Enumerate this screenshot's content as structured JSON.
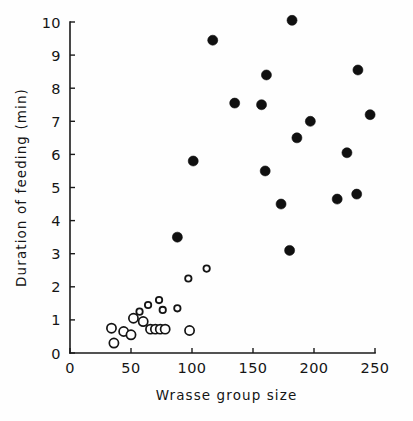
{
  "chart_data": {
    "type": "scatter",
    "title": "",
    "xlabel": "Wrasse group size",
    "ylabel": "Duration of feeding (min)",
    "xlim": [
      0,
      260
    ],
    "ylim": [
      0,
      10.3
    ],
    "xticks": [
      0,
      50,
      100,
      150,
      200,
      250
    ],
    "xtick_labels": [
      "0",
      "50",
      "100",
      "150",
      "200",
      "250"
    ],
    "yticks": [
      0,
      1,
      2,
      3,
      4,
      5,
      6,
      7,
      8,
      9,
      10
    ],
    "ytick_labels": [
      "0",
      "1",
      "2",
      "3",
      "4",
      "5",
      "6",
      "7",
      "8",
      "9",
      "10"
    ],
    "grid": false,
    "legend": false,
    "series": [
      {
        "name": "filled-circles",
        "marker": "filled-circle",
        "color": "#101010",
        "points": [
          {
            "x": 117,
            "y": 9.45
          },
          {
            "x": 182,
            "y": 10.05
          },
          {
            "x": 135,
            "y": 7.55
          },
          {
            "x": 157,
            "y": 7.5
          },
          {
            "x": 161,
            "y": 8.4
          },
          {
            "x": 197,
            "y": 7.0
          },
          {
            "x": 186,
            "y": 6.5
          },
          {
            "x": 160,
            "y": 5.5
          },
          {
            "x": 173,
            "y": 4.5
          },
          {
            "x": 180,
            "y": 3.1
          },
          {
            "x": 219,
            "y": 4.65
          },
          {
            "x": 227,
            "y": 6.05
          },
          {
            "x": 235,
            "y": 4.8
          },
          {
            "x": 236,
            "y": 8.55
          },
          {
            "x": 246,
            "y": 7.2
          },
          {
            "x": 101,
            "y": 5.8
          },
          {
            "x": 88,
            "y": 3.5
          }
        ]
      },
      {
        "name": "open-circles",
        "marker": "open-circle",
        "color": "#141414",
        "points": [
          {
            "x": 36,
            "y": 0.3
          },
          {
            "x": 34,
            "y": 0.75
          },
          {
            "x": 44,
            "y": 0.65
          },
          {
            "x": 50,
            "y": 0.55
          },
          {
            "x": 52,
            "y": 1.05
          },
          {
            "x": 57,
            "y": 1.25
          },
          {
            "x": 60,
            "y": 0.95
          },
          {
            "x": 64,
            "y": 1.45
          },
          {
            "x": 66,
            "y": 0.72
          },
          {
            "x": 70,
            "y": 0.72
          },
          {
            "x": 74,
            "y": 0.72
          },
          {
            "x": 78,
            "y": 0.72
          },
          {
            "x": 76,
            "y": 1.3
          },
          {
            "x": 98,
            "y": 0.68
          },
          {
            "x": 73,
            "y": 1.6
          },
          {
            "x": 88,
            "y": 1.35
          },
          {
            "x": 97,
            "y": 2.25
          },
          {
            "x": 112,
            "y": 2.55
          }
        ]
      }
    ]
  },
  "axes": {
    "x_title": "Wrasse group size",
    "y_title": "Duration of feeding (min)"
  }
}
